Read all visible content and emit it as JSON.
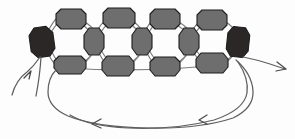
{
  "figure": {
    "width": 295,
    "height": 139,
    "background_color": "#fdfdfd"
  },
  "palette": {
    "node_gray_fill": "#6e6e6e",
    "node_dark_fill": "#2a2726",
    "node_outline": "#1d1d1d",
    "edge_color": "#7e7e7e",
    "flow_color": "#5f5f5f",
    "arrow_color": "#4a4a4a"
  },
  "nodes": {
    "terminals": [
      {
        "id": "terminal-left",
        "label": "",
        "shape": "ellipse",
        "fill_key": "node_dark_fill",
        "cx": 42,
        "cy": 42,
        "rx": 12,
        "ry": 15,
        "rotation": -8
      },
      {
        "id": "terminal-right",
        "label": "",
        "shape": "ellipse",
        "fill_key": "node_dark_fill",
        "cx": 238,
        "cy": 42,
        "rx": 11,
        "ry": 15,
        "rotation": 6
      }
    ],
    "top_row": [
      {
        "id": "top-1",
        "label": "",
        "shape": "octagon",
        "fill_key": "node_gray_fill",
        "cx": 71,
        "cy": 19,
        "rx": 15,
        "ry": 10
      },
      {
        "id": "top-2",
        "label": "",
        "shape": "octagon",
        "fill_key": "node_gray_fill",
        "cx": 119,
        "cy": 18,
        "rx": 16,
        "ry": 10
      },
      {
        "id": "top-3",
        "label": "",
        "shape": "octagon",
        "fill_key": "node_gray_fill",
        "cx": 165,
        "cy": 19,
        "rx": 15,
        "ry": 10
      },
      {
        "id": "top-4",
        "label": "",
        "shape": "octagon",
        "fill_key": "node_gray_fill",
        "cx": 212,
        "cy": 20,
        "rx": 15,
        "ry": 10
      }
    ],
    "middle_row": [
      {
        "id": "mid-1",
        "label": "",
        "shape": "ellipse",
        "fill_key": "node_gray_fill",
        "cx": 94,
        "cy": 41,
        "rx": 10,
        "ry": 14
      },
      {
        "id": "mid-2",
        "label": "",
        "shape": "ellipse",
        "fill_key": "node_gray_fill",
        "cx": 142,
        "cy": 41,
        "rx": 10,
        "ry": 14
      },
      {
        "id": "mid-3",
        "label": "",
        "shape": "ellipse",
        "fill_key": "node_gray_fill",
        "cx": 189,
        "cy": 41,
        "rx": 10,
        "ry": 14
      }
    ],
    "bottom_row": [
      {
        "id": "bot-1",
        "label": "",
        "shape": "octagon",
        "fill_key": "node_gray_fill",
        "cx": 70,
        "cy": 64,
        "rx": 16,
        "ry": 10
      },
      {
        "id": "bot-2",
        "label": "",
        "shape": "octagon",
        "fill_key": "node_gray_fill",
        "cx": 118,
        "cy": 66,
        "rx": 16,
        "ry": 11
      },
      {
        "id": "bot-3",
        "label": "",
        "shape": "octagon",
        "fill_key": "node_gray_fill",
        "cx": 165,
        "cy": 66,
        "rx": 15,
        "ry": 10
      },
      {
        "id": "bot-4",
        "label": "",
        "shape": "octagon",
        "fill_key": "node_gray_fill",
        "cx": 212,
        "cy": 63,
        "rx": 16,
        "ry": 11
      }
    ]
  },
  "edges": {
    "count": 22,
    "description": "thin gray links forming four fused rings between terminals"
  },
  "flows": {
    "input_arrow": {
      "id": "input-arrow",
      "label": "",
      "direction": "up-right",
      "tip_x": 31,
      "tip_y": 77
    },
    "output_arrow": {
      "id": "output-arrow",
      "label": "",
      "direction": "right",
      "tip_x": 286,
      "tip_y": 69
    },
    "feedback_loop": {
      "id": "feedback-loop",
      "label": "",
      "direction": "right-to-left",
      "arrowhead_positions": [
        {
          "x": 200,
          "y": 120
        },
        {
          "x": 93,
          "y": 124
        }
      ]
    }
  }
}
